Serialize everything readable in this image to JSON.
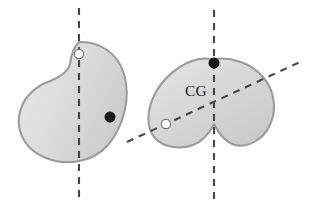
{
  "figure": {
    "background_color": "#ffffff",
    "width": 309,
    "height": 205,
    "colors": {
      "blob_fill_light": "#e9e9e9",
      "blob_fill_mid": "#d6d6d6",
      "blob_fill_dark": "#cacaca",
      "blob_outline": "#9a9a9a",
      "dash_line": "#454545",
      "pivot_black": "#1a1a1a",
      "pivot_white": "#ffffff",
      "label_color": "#1c1c1c"
    }
  },
  "left_object": {
    "name": "bean-shape",
    "shape_path": "M 79 42 C 99 41 118 53 124 74 C 131 97 124 126 108 145 C 92 163 66 166 46 158 C 27 151 17 134 19 117 C 21 99 34 87 50 81 C 60 77 68 72 70 64 C 71 55 73 48 79 42 Z",
    "vertical_axis": {
      "label": "vertical-suspension-line",
      "x": 79,
      "y_start": 8,
      "y_end": 198
    },
    "suspension_point": {
      "label": "suspension-point-white",
      "cx": 79,
      "cy": 54,
      "r": 4.6,
      "style": "white"
    },
    "marker_point": {
      "label": "reference-point-black",
      "cx": 110,
      "cy": 117,
      "r": 5.2,
      "style": "black"
    }
  },
  "right_object": {
    "name": "heart-shape",
    "shape_path": "M 214 59 C 232 57 251 63 263 77 C 275 91 277 110 270 125 C 263 140 248 148 235 145 C 224 142 218 132 214 124 C 210 132 204 141 193 145 C 179 150 163 147 155 138 C 146 128 147 112 153 98 C 161 79 180 63 199 59 C 204 58 209 59 214 59 Z",
    "vertical_axis": {
      "label": "vertical-suspension-line",
      "x": 214,
      "y_start": 10,
      "y_end": 200
    },
    "diagonal_axis": {
      "label": "diagonal-suspension-line",
      "x_start": 127,
      "y_start": 142,
      "x_end": 300,
      "y_end": 62
    },
    "suspension_point_top": {
      "label": "suspension-point-black",
      "cx": 214,
      "cy": 63,
      "r": 5.2,
      "style": "black"
    },
    "suspension_point_side": {
      "label": "suspension-point-white",
      "cx": 166,
      "cy": 124,
      "r": 4.6,
      "style": "white"
    },
    "cg_label": {
      "text": "CG",
      "x": 196,
      "y": 96
    }
  }
}
